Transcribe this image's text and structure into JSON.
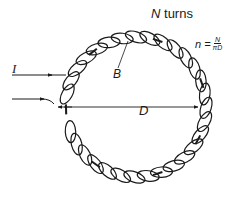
{
  "diagram": {
    "labels": {
      "turns_N": "N",
      "turns_word": "turns",
      "current": "I",
      "field": "B",
      "diameter": "D",
      "formula_lhs": "n =",
      "formula_num": "N",
      "formula_den": "πD"
    },
    "geometry": {
      "center": [
        136,
        107
      ],
      "radius": 70,
      "loop_count": 30,
      "gap_angle_start_deg": 165,
      "gap_angle_end_deg": 185
    },
    "colors": {
      "stroke": "#1a1a1a",
      "background": "#ffffff"
    }
  }
}
